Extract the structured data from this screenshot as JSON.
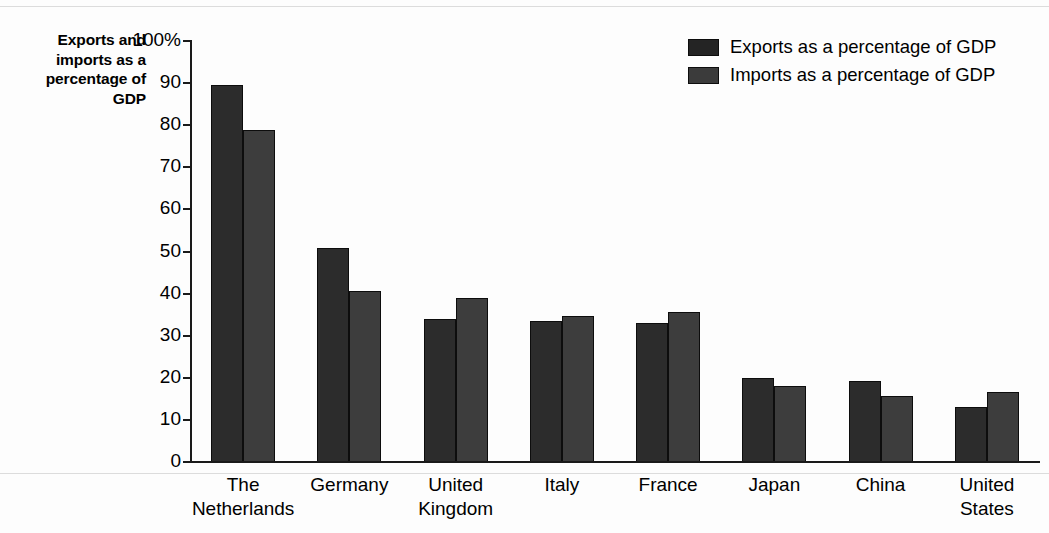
{
  "chart_data": {
    "type": "bar",
    "title": "",
    "ylabel": "Exports and imports as a percentage of GDP",
    "xlabel": "",
    "ylim": [
      0,
      100
    ],
    "yticks": [
      "0",
      "10",
      "20",
      "30",
      "40",
      "50",
      "60",
      "70",
      "80",
      "90",
      "100%"
    ],
    "ytick_values": [
      0,
      10,
      20,
      30,
      40,
      50,
      60,
      70,
      80,
      90,
      100
    ],
    "grid": false,
    "legend_position": "top-right",
    "categories": [
      "The\nNetherlands",
      "Germany",
      "United\nKingdom",
      "Italy",
      "France",
      "Japan",
      "China",
      "United\nStates"
    ],
    "series": [
      {
        "name": "Exports as a percentage of GDP",
        "color": "#2c2c2c",
        "values": [
          89.3,
          50.5,
          33.7,
          33.2,
          32.7,
          19.6,
          19.1,
          12.9
        ]
      },
      {
        "name": "Imports as a percentage of GDP",
        "color": "#3d3d3d",
        "values": [
          78.7,
          40.3,
          38.7,
          34.4,
          35.3,
          17.8,
          15.5,
          16.4
        ]
      }
    ]
  },
  "axis_title": {
    "lines": [
      "Exports and",
      "imports as a",
      "percentage of",
      "GDP"
    ]
  },
  "legend": {
    "items": [
      {
        "label": "Exports as a percentage of GDP",
        "swatch": "exports"
      },
      {
        "label": "Imports as a percentage of GDP",
        "swatch": "imports"
      }
    ]
  }
}
